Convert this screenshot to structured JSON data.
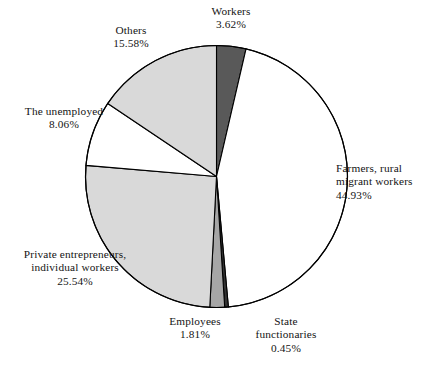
{
  "chart_data": {
    "type": "pie",
    "title": "",
    "subtitle": "",
    "xlabel": "",
    "ylabel": "",
    "legend_position": "none",
    "grid": false,
    "unit": "%",
    "start_angle_deg": 0,
    "direction": "clockwise",
    "categories": [
      "Workers",
      "Farmers, rural migrant workers",
      "State functionaries",
      "Employees",
      "Private entrepreneurs, individual workers",
      "The unemployed",
      "Others"
    ],
    "values": [
      3.62,
      44.93,
      0.45,
      1.81,
      25.54,
      8.06,
      15.58
    ],
    "colors": [
      "#595959",
      "#ffffff",
      "#333333",
      "#a6a6a6",
      "#d9d9d9",
      "#ffffff",
      "#d9d9d9"
    ],
    "slice_outline_color": "#000000",
    "background_color": "#ffffff",
    "slices": [
      {
        "name": "Workers",
        "value": 3.62,
        "value_label": "3.62%",
        "color": "#595959",
        "label_lines": [
          "Workers",
          "3.62%"
        ]
      },
      {
        "name": "Farmers, rural migrant workers",
        "value": 44.93,
        "value_label": "44.93%",
        "color": "#ffffff",
        "label_lines": [
          "Farmers, rural",
          "migrant workers",
          "44.93%"
        ]
      },
      {
        "name": "State functionaries",
        "value": 0.45,
        "value_label": "0.45%",
        "color": "#333333",
        "label_lines": [
          "State",
          "functionaries",
          "0.45%"
        ]
      },
      {
        "name": "Employees",
        "value": 1.81,
        "value_label": "1.81%",
        "color": "#a6a6a6",
        "label_lines": [
          "Employees",
          "1.81%"
        ]
      },
      {
        "name": "Private entrepreneurs, individual workers",
        "value": 25.54,
        "value_label": "25.54%",
        "color": "#d9d9d9",
        "label_lines": [
          "Private entrepreneurs,",
          "individual workers",
          "25.54%"
        ]
      },
      {
        "name": "The unemployed",
        "value": 8.06,
        "value_label": "8.06%",
        "color": "#ffffff",
        "label_lines": [
          "The unemployed",
          "8.06%"
        ]
      },
      {
        "name": "Others",
        "value": 15.58,
        "value_label": "15.58%",
        "color": "#d9d9d9",
        "label_lines": [
          "Others",
          "15.58%"
        ]
      }
    ]
  },
  "labels": {
    "workers": {
      "line1": "Workers",
      "line2": "3.62%"
    },
    "others": {
      "line1": "Others",
      "line2": "15.58%"
    },
    "unemployed": {
      "line1": "The unemployed",
      "line2": "8.06%"
    },
    "private": {
      "line1": "Private entrepreneurs,",
      "line2": "individual workers",
      "line3": "25.54%"
    },
    "employees": {
      "line1": "Employees",
      "line2": "1.81%"
    },
    "state": {
      "line1": "State",
      "line2": "functionaries",
      "line3": "0.45%"
    },
    "farmers": {
      "line1": "Farmers, rural",
      "line2": "migrant workers",
      "line3": "44.93%"
    }
  },
  "geometry": {
    "center_x": 216.5,
    "center_y": 176.5,
    "radius": 131
  }
}
